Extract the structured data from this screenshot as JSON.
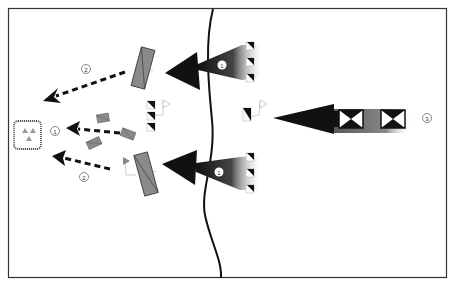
{
  "diagram": {
    "frame": {
      "x": 8,
      "y": 8,
      "w": 439,
      "h": 270,
      "stroke": "#333333"
    },
    "boundary_line": {
      "label": "front-line",
      "color": "#111111"
    },
    "labels": [
      {
        "id": "main-attack-north",
        "text": "1",
        "x": 222,
        "y": 65,
        "style": "white"
      },
      {
        "id": "main-attack-south",
        "text": "1",
        "x": 219,
        "y": 172,
        "style": "white"
      },
      {
        "id": "withdraw-north",
        "text": "2",
        "x": 86,
        "y": 69,
        "style": "outline"
      },
      {
        "id": "withdraw-center",
        "text": "2",
        "x": 55,
        "y": 131,
        "style": "outline"
      },
      {
        "id": "withdraw-south",
        "text": "2",
        "x": 84,
        "y": 177,
        "style": "outline"
      },
      {
        "id": "reserve-attack",
        "text": "3",
        "x": 427,
        "y": 118,
        "style": "outline"
      }
    ],
    "colors": {
      "arrow_dark": "#111111",
      "arrow_fade": "#cccccc",
      "unit_gray": "#8a8a8a",
      "unit_outline": "#333333",
      "light_gray": "#999999"
    }
  }
}
